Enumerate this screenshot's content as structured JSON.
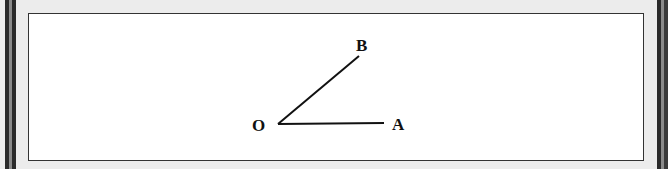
{
  "figure": {
    "type": "angle-diagram",
    "vertex": {
      "label": "O"
    },
    "rays": [
      {
        "label": "A",
        "direction": "horizontal-right"
      },
      {
        "label": "B",
        "direction": "upper-right"
      }
    ],
    "colors": {
      "line": "#111111",
      "panel_bg": "#ffffff",
      "frame_dark": "#2a2a2a",
      "frame_mid": "#7a7a7a",
      "outer_bg": "#ececec"
    }
  }
}
